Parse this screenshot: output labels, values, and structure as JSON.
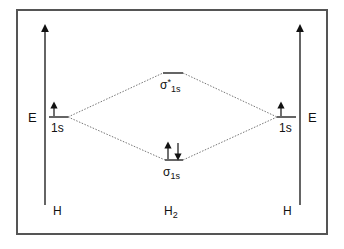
{
  "diagram": {
    "left_atom": {
      "label": "H",
      "axis_label": "E",
      "orbital_label": "1s",
      "electrons": [
        "up"
      ]
    },
    "right_atom": {
      "label": "H",
      "axis_label": "E",
      "orbital_label": "1s",
      "electrons": [
        "up"
      ]
    },
    "molecule": {
      "label_main": "H",
      "label_sub": "2",
      "antibonding": {
        "symbol": "σ",
        "sup": "*",
        "sub": "1s",
        "electrons": []
      },
      "bonding": {
        "symbol": "σ",
        "sub": "1s",
        "electrons": [
          "up",
          "down"
        ]
      }
    },
    "colors": {
      "line": "#111111",
      "frame": "#555555",
      "dotted": "#666666"
    }
  }
}
